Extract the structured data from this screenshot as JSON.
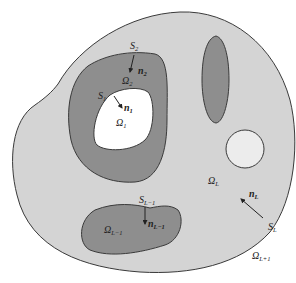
{
  "diagram": {
    "colors": {
      "background": "#ffffff",
      "outer_region_fill": "#d4d4d4",
      "inclusion_fill": "#8e8e8e",
      "hole_fill": "#ffffff",
      "small_circle_fill": "#ececec",
      "stroke": "#3a3a3a",
      "text": "#222222"
    },
    "regions": [
      {
        "id": "omega_1",
        "label": "Ω",
        "sub": "1",
        "kind": "hole"
      },
      {
        "id": "omega_2",
        "label": "Ω",
        "sub": "2",
        "kind": "inclusion"
      },
      {
        "id": "omega_L_minus_1",
        "label": "Ω",
        "sub": "L−1",
        "kind": "inclusion"
      },
      {
        "id": "omega_L",
        "label": "Ω",
        "sub": "L",
        "kind": "matrix"
      },
      {
        "id": "omega_L_plus_1",
        "label": "Ω",
        "sub": "L+1",
        "kind": "exterior"
      }
    ],
    "surfaces": [
      {
        "id": "S_1",
        "label": "S",
        "sub": "1"
      },
      {
        "id": "S_2",
        "label": "S",
        "sub": "2"
      },
      {
        "id": "S_L_minus_1",
        "label": "S",
        "sub": "L−1"
      },
      {
        "id": "S_L",
        "label": "S",
        "sub": "L"
      }
    ],
    "normals": [
      {
        "id": "n_1",
        "label": "n",
        "sub": "1"
      },
      {
        "id": "n_2",
        "label": "n",
        "sub": "2"
      },
      {
        "id": "n_L_minus_1",
        "label": "n",
        "sub": "L−1"
      },
      {
        "id": "n_L",
        "label": "n",
        "sub": "L"
      }
    ]
  }
}
